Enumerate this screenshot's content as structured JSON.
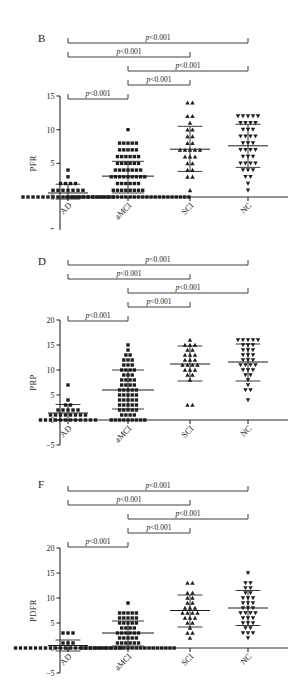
{
  "figure": {
    "background": "#ffffff",
    "accent": "#1a1a1a",
    "width": 301,
    "height": 683
  },
  "panels": [
    {
      "letter": "B",
      "ylabel": "PFR",
      "ylim": [
        -5,
        15
      ],
      "yticks": [
        -5,
        0,
        5,
        10,
        15
      ],
      "ytick_labels": [
        "−5",
        "0",
        "5",
        "10",
        "15"
      ]
    },
    {
      "letter": "D",
      "ylabel": "PRP",
      "ylim": [
        -5,
        20
      ],
      "yticks": [
        -5,
        0,
        5,
        10,
        15,
        20
      ],
      "ytick_labels": [
        "−5",
        "0",
        "5",
        "10",
        "15",
        "20"
      ]
    },
    {
      "letter": "F",
      "ylabel": "PDFR",
      "ylim": [
        -5,
        20
      ],
      "yticks": [
        -5,
        0,
        5,
        10,
        15,
        20
      ],
      "ytick_labels": [
        "−5",
        "0",
        "5",
        "10",
        "15",
        "20"
      ]
    }
  ],
  "categories": [
    "AD",
    "aMCI",
    "SCI",
    "NC"
  ],
  "pvalue_label": "p<0.001",
  "pvalue_p": "p",
  "pvalue_rest": "<0.001",
  "chart_data": [
    {
      "type": "scatter",
      "title": "B",
      "xlabel": "",
      "ylabel": "PFR",
      "ylim": [
        -5,
        15
      ],
      "yticks": [
        -5,
        0,
        5,
        10,
        15
      ],
      "grid": false,
      "legend": "none",
      "categories": [
        "AD",
        "aMCI",
        "SCI",
        "NC"
      ],
      "markers": [
        "square",
        "square",
        "triangle-up",
        "triangle-down"
      ],
      "summary": [
        {
          "group": "AD",
          "mean": 0.6,
          "sd_upper": 1.9,
          "sd_lower": -0.3
        },
        {
          "group": "aMCI",
          "mean": 3.1,
          "sd_upper": 5.3,
          "sd_lower": 0.6
        },
        {
          "group": "SCI",
          "mean": 7.1,
          "sd_upper": 10.5,
          "sd_lower": 3.8
        },
        {
          "group": "NC",
          "mean": 7.6,
          "sd_upper": 10.8,
          "sd_lower": 4.4
        }
      ],
      "points": {
        "AD": [
          0,
          0,
          0,
          0,
          0,
          0,
          0,
          0,
          0,
          0,
          0,
          0,
          0,
          0,
          0,
          0,
          0,
          0,
          0,
          1,
          1,
          1,
          1,
          1,
          1,
          1,
          2,
          2,
          2,
          2,
          3,
          4
        ],
        "aMCI": [
          0,
          0,
          0,
          0,
          0,
          0,
          0,
          0,
          0,
          0,
          0,
          0,
          0,
          0,
          0,
          0,
          0,
          0,
          0,
          0,
          0,
          0,
          0,
          0,
          0,
          0,
          0,
          0,
          0,
          0,
          1,
          1,
          1,
          1,
          1,
          1,
          1,
          1,
          2,
          2,
          2,
          2,
          2,
          2,
          3,
          3,
          3,
          3,
          3,
          3,
          3,
          3,
          3,
          4,
          4,
          4,
          4,
          4,
          4,
          4,
          5,
          5,
          5,
          5,
          5,
          5,
          6,
          6,
          6,
          6,
          6,
          6,
          7,
          7,
          7,
          7,
          7,
          8,
          8,
          8,
          8,
          8,
          10
        ],
        "SCI": [
          1,
          3,
          3,
          4,
          4,
          5,
          5,
          6,
          6,
          6,
          7,
          7,
          7,
          7,
          7,
          8,
          8,
          9,
          9,
          10,
          10,
          11,
          12,
          12,
          14,
          14
        ],
        "NC": [
          1,
          2,
          3,
          3,
          4,
          4,
          4,
          5,
          5,
          5,
          5,
          6,
          6,
          6,
          7,
          7,
          7,
          7,
          8,
          8,
          8,
          9,
          9,
          9,
          9,
          10,
          10,
          10,
          11,
          11,
          11,
          11,
          12,
          12,
          12,
          12,
          12
        ],
        "note": "values rounded to nearest chart unit"
      },
      "comparisons": [
        {
          "from": "AD",
          "to": "aMCI",
          "label": "p<0.001",
          "tier": 1
        },
        {
          "from": "aMCI",
          "to": "SCI",
          "label": "p<0.001",
          "tier": 2
        },
        {
          "from": "aMCI",
          "to": "NC",
          "label": "p<0.001",
          "tier": 3
        },
        {
          "from": "AD",
          "to": "SCI",
          "label": "p<0.001",
          "tier": 4
        },
        {
          "from": "AD",
          "to": "NC",
          "label": "p<0.001",
          "tier": 5
        }
      ]
    },
    {
      "type": "scatter",
      "title": "D",
      "xlabel": "",
      "ylabel": "PRP",
      "ylim": [
        -5,
        20
      ],
      "yticks": [
        -5,
        0,
        5,
        10,
        15,
        20
      ],
      "grid": false,
      "legend": "none",
      "categories": [
        "AD",
        "aMCI",
        "SCI",
        "NC"
      ],
      "markers": [
        "square",
        "square",
        "triangle-up",
        "triangle-down"
      ],
      "summary": [
        {
          "group": "AD",
          "mean": 1.4,
          "sd_upper": 3.1,
          "sd_lower": 0.0
        },
        {
          "group": "aMCI",
          "mean": 6.0,
          "sd_upper": 10.0,
          "sd_lower": 2.2
        },
        {
          "group": "SCI",
          "mean": 11.2,
          "sd_upper": 14.8,
          "sd_lower": 7.8
        },
        {
          "group": "NC",
          "mean": 11.6,
          "sd_upper": 15.2,
          "sd_lower": 7.8
        }
      ],
      "points": {
        "AD": [
          0,
          0,
          0,
          0,
          0,
          0,
          0,
          0,
          0,
          0,
          0,
          0,
          1,
          1,
          1,
          1,
          1,
          1,
          1,
          1,
          2,
          2,
          2,
          2,
          2,
          3,
          3,
          4,
          7
        ],
        "aMCI": [
          0,
          0,
          0,
          0,
          0,
          0,
          0,
          0,
          0,
          1,
          1,
          1,
          1,
          2,
          2,
          2,
          2,
          2,
          3,
          3,
          3,
          3,
          3,
          4,
          4,
          4,
          4,
          4,
          5,
          5,
          5,
          5,
          5,
          6,
          6,
          6,
          6,
          6,
          7,
          7,
          7,
          7,
          8,
          8,
          8,
          8,
          9,
          9,
          9,
          10,
          10,
          10,
          10,
          11,
          11,
          11,
          12,
          12,
          12,
          13,
          13,
          14,
          15
        ],
        "SCI": [
          3,
          3,
          8,
          9,
          9,
          10,
          10,
          10,
          11,
          11,
          11,
          11,
          12,
          12,
          12,
          13,
          13,
          13,
          14,
          14,
          15,
          15,
          15,
          16
        ],
        "NC": [
          4,
          6,
          6,
          7,
          8,
          9,
          9,
          10,
          10,
          10,
          11,
          11,
          11,
          11,
          12,
          12,
          12,
          13,
          13,
          13,
          14,
          14,
          14,
          15,
          15,
          15,
          16,
          16,
          16,
          16,
          16
        ]
      },
      "comparisons": [
        {
          "from": "AD",
          "to": "aMCI",
          "label": "p<0.001",
          "tier": 1
        },
        {
          "from": "aMCI",
          "to": "SCI",
          "label": "p<0.001",
          "tier": 2
        },
        {
          "from": "aMCI",
          "to": "NC",
          "label": "p<0.001",
          "tier": 3
        },
        {
          "from": "AD",
          "to": "SCI",
          "label": "p<0.001",
          "tier": 4
        },
        {
          "from": "AD",
          "to": "NC",
          "label": "p<0.001",
          "tier": 5
        }
      ]
    },
    {
      "type": "scatter",
      "title": "F",
      "xlabel": "",
      "ylabel": "PDFR",
      "ylim": [
        -5,
        20
      ],
      "yticks": [
        -5,
        0,
        5,
        10,
        15,
        20
      ],
      "grid": false,
      "legend": "none",
      "categories": [
        "AD",
        "aMCI",
        "SCI",
        "NC"
      ],
      "markers": [
        "square",
        "square",
        "triangle-up",
        "triangle-down"
      ],
      "summary": [
        {
          "group": "AD",
          "mean": 0.5,
          "sd_upper": 1.6,
          "sd_lower": -0.6
        },
        {
          "group": "aMCI",
          "mean": 3.0,
          "sd_upper": 5.4,
          "sd_lower": 0.4
        },
        {
          "group": "SCI",
          "mean": 7.5,
          "sd_upper": 10.6,
          "sd_lower": 4.2
        },
        {
          "group": "NC",
          "mean": 8.0,
          "sd_upper": 11.5,
          "sd_lower": 4.5
        }
      ],
      "points": {
        "AD": [
          0,
          0,
          0,
          0,
          0,
          0,
          0,
          0,
          0,
          0,
          0,
          0,
          0,
          0,
          0,
          0,
          0,
          0,
          0,
          0,
          0,
          0,
          1,
          1,
          1,
          3,
          3,
          3
        ],
        "aMCI": [
          0,
          0,
          0,
          0,
          0,
          0,
          0,
          0,
          0,
          0,
          0,
          0,
          0,
          0,
          0,
          0,
          0,
          0,
          0,
          0,
          0,
          0,
          0,
          1,
          1,
          1,
          1,
          1,
          1,
          2,
          2,
          2,
          2,
          2,
          3,
          3,
          3,
          3,
          3,
          3,
          4,
          4,
          4,
          4,
          5,
          5,
          5,
          5,
          5,
          6,
          6,
          6,
          6,
          6,
          7,
          7,
          7,
          7,
          7,
          9
        ],
        "SCI": [
          2,
          3,
          3,
          4,
          5,
          5,
          6,
          6,
          6,
          7,
          7,
          7,
          7,
          8,
          8,
          8,
          9,
          9,
          10,
          10,
          11,
          11,
          13,
          13
        ],
        "NC": [
          2,
          3,
          3,
          3,
          4,
          4,
          5,
          5,
          5,
          6,
          6,
          6,
          7,
          7,
          7,
          7,
          8,
          8,
          8,
          9,
          9,
          9,
          10,
          10,
          10,
          11,
          11,
          12,
          12,
          13,
          13,
          15
        ]
      },
      "comparisons": [
        {
          "from": "AD",
          "to": "aMCI",
          "label": "p<0.001",
          "tier": 1
        },
        {
          "from": "aMCI",
          "to": "SCI",
          "label": "p<0.001",
          "tier": 2
        },
        {
          "from": "aMCI",
          "to": "NC",
          "label": "p<0.001",
          "tier": 3
        },
        {
          "from": "AD",
          "to": "SCI",
          "label": "p<0.001",
          "tier": 4
        },
        {
          "from": "AD",
          "to": "NC",
          "label": "p<0.001",
          "tier": 5
        }
      ]
    }
  ]
}
